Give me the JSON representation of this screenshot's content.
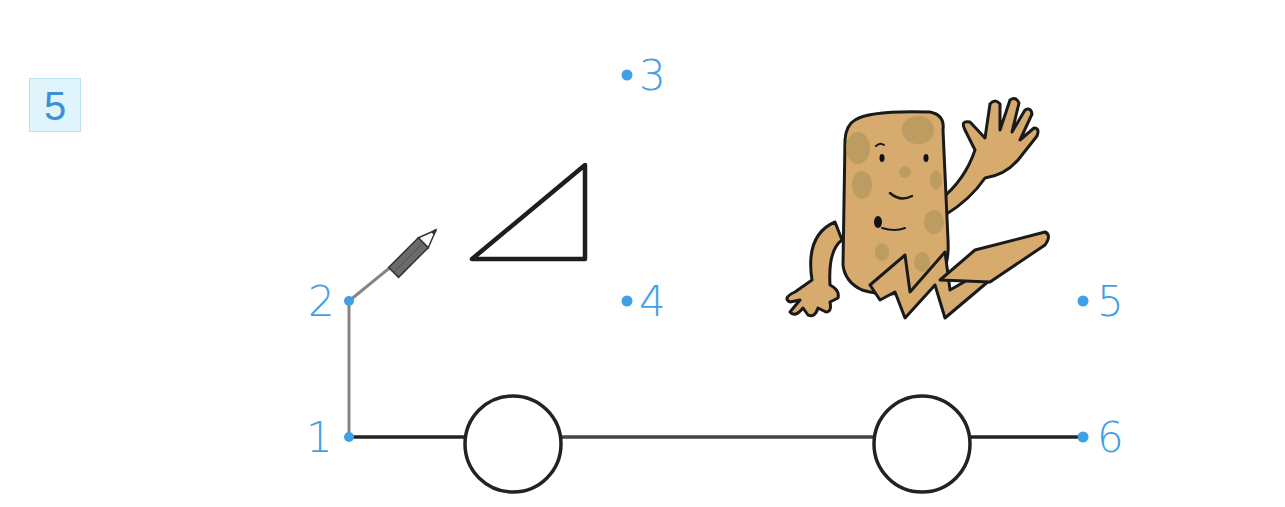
{
  "task": {
    "number": "5"
  },
  "dots": [
    {
      "label": "1",
      "x": 349,
      "y": 437
    },
    {
      "label": "2",
      "x": 349,
      "y": 301
    },
    {
      "label": "3",
      "x": 627,
      "y": 75
    },
    {
      "label": "4",
      "x": 627,
      "y": 301
    },
    {
      "label": "5",
      "x": 1083,
      "y": 301
    },
    {
      "label": "6",
      "x": 1083,
      "y": 437
    }
  ],
  "shapes": {
    "triangle": "right-triangle",
    "wheels": 2
  },
  "illustration": {
    "character": "running-potato-character",
    "tool": "pencil-icon"
  },
  "colors": {
    "dot_blue": "#3fa0e6",
    "badge_bg": "#dff4fb",
    "badge_text": "#3d8fd6",
    "line_dark": "#222222",
    "line_gray": "#808080",
    "potato": "#d7ab6d",
    "potato_spot": "#b89a5e"
  }
}
